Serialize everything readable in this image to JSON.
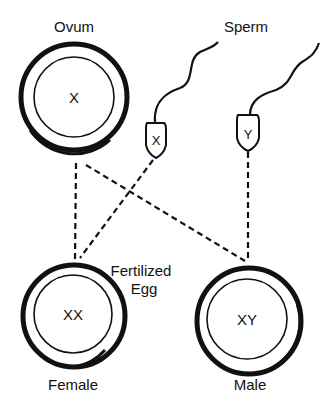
{
  "diagram": {
    "type": "sex-determination",
    "labels": {
      "ovum": "Ovum",
      "sperm": "Sperm",
      "fertilized_line1": "Fertilized",
      "fertilized_line2": "Egg",
      "female": "Female",
      "male": "Male"
    },
    "ovum": {
      "chromosome": "X"
    },
    "sperm": [
      {
        "chromosome": "X"
      },
      {
        "chromosome": "Y"
      }
    ],
    "offspring": [
      {
        "sex": "Female",
        "chromosomes": "XX"
      },
      {
        "sex": "Male",
        "chromosomes": "XY"
      }
    ],
    "connections": [
      {
        "from": "ovum",
        "to": "female"
      },
      {
        "from": "ovum",
        "to": "male"
      },
      {
        "from": "sperm-x",
        "to": "female"
      },
      {
        "from": "sperm-y",
        "to": "male"
      }
    ],
    "colors": {
      "stroke": "#111111",
      "background": "#ffffff"
    }
  }
}
